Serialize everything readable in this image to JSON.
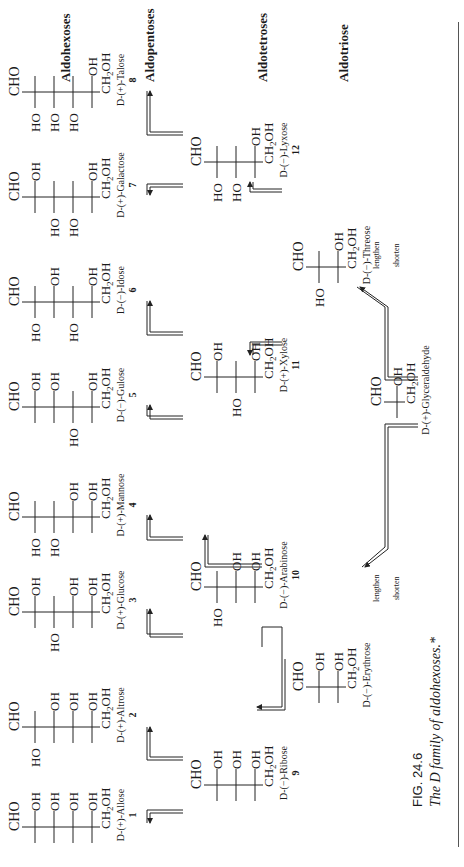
{
  "figure": {
    "number": "FIG. 24.6",
    "caption": "The D family of aldohexoses.*",
    "sections": {
      "hexoses": "Aldohexoses",
      "pentoses": "Aldopentoses",
      "tetroses": "Aldotetroses",
      "triose": "Aldotriose"
    },
    "arrows": {
      "lengthen": "lengthen",
      "shorten": "shorten"
    },
    "sugars": [
      {
        "id": 1,
        "name": "D-(+)-Allose",
        "number": "1",
        "top": "CHO",
        "bottom": "CH2OH",
        "rows": [
          "R",
          "R",
          "R",
          "R"
        ]
      },
      {
        "id": 2,
        "name": "D-(+)-Altrose",
        "number": "2",
        "top": "CHO",
        "bottom": "CH2OH",
        "rows": [
          "L",
          "R",
          "R",
          "R"
        ]
      },
      {
        "id": 3,
        "name": "D-(+)-Glucose",
        "number": "3",
        "top": "CHO",
        "bottom": "CH2OH",
        "rows": [
          "R",
          "L",
          "R",
          "R"
        ]
      },
      {
        "id": 4,
        "name": "D-(+)-Mannose",
        "number": "4",
        "top": "CHO",
        "bottom": "CH2OH",
        "rows": [
          "L",
          "L",
          "R",
          "R"
        ]
      },
      {
        "id": 5,
        "name": "D-(−)-Gulose",
        "number": "5",
        "top": "CHO",
        "bottom": "CH2OH",
        "rows": [
          "R",
          "R",
          "L",
          "R"
        ]
      },
      {
        "id": 6,
        "name": "D-(−)-Idose",
        "number": "6",
        "top": "CHO",
        "bottom": "CH2OH",
        "rows": [
          "L",
          "R",
          "L",
          "R"
        ]
      },
      {
        "id": 7,
        "name": "D-(+)-Galactose",
        "number": "7",
        "top": "CHO",
        "bottom": "CH2OH",
        "rows": [
          "R",
          "L",
          "L",
          "R"
        ]
      },
      {
        "id": 8,
        "name": "D-(+)-Talose",
        "number": "8",
        "top": "CHO",
        "bottom": "CH2OH",
        "rows": [
          "L",
          "L",
          "L",
          "R"
        ]
      },
      {
        "id": 9,
        "name": "D-(−)-Ribose",
        "number": "9",
        "top": "CHO",
        "bottom": "CH2OH",
        "rows": [
          "R",
          "R",
          "R"
        ]
      },
      {
        "id": 10,
        "name": "D-(−)-Arabinose",
        "number": "10",
        "top": "CHO",
        "bottom": "CH2OH",
        "rows": [
          "L",
          "R",
          "R"
        ]
      },
      {
        "id": 11,
        "name": "D-(+)-Xylose",
        "number": "11",
        "top": "CHO",
        "bottom": "CH2OH",
        "rows": [
          "R",
          "L",
          "R"
        ]
      },
      {
        "id": 12,
        "name": "D-(−)-Lyxose",
        "number": "12",
        "top": "CHO",
        "bottom": "CH2OH",
        "rows": [
          "L",
          "L",
          "R"
        ]
      },
      {
        "id": 13,
        "name": "D-(−)-Erythrose",
        "number": "",
        "top": "CHO",
        "bottom": "CH2OH",
        "rows": [
          "R",
          "R"
        ]
      },
      {
        "id": 14,
        "name": "D-(−)-Threose",
        "number": "",
        "top": "CHO",
        "bottom": "CH2OH",
        "rows": [
          "L",
          "R"
        ]
      },
      {
        "id": 15,
        "name": "D-(+)-Glyceraldehyde",
        "number": "",
        "top": "CHO",
        "bottom": "CH2OH",
        "rows": [
          "R"
        ]
      }
    ],
    "labels": {
      "oh": "OH",
      "ho": "HO",
      "cho": "CHO",
      "ch2oh_main": "CH",
      "ch2oh_sub": "2",
      "ch2oh_tail": "OH"
    }
  }
}
